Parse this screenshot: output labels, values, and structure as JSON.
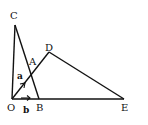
{
  "diagram": {
    "type": "geometry",
    "points": {
      "O": {
        "label": "O",
        "x": 12,
        "y": 99,
        "lx": 7,
        "ly": 110
      },
      "B": {
        "label": "B",
        "x": 39,
        "y": 99,
        "lx": 36,
        "ly": 110
      },
      "E": {
        "label": "E",
        "x": 124,
        "y": 99,
        "lx": 121,
        "ly": 110
      },
      "C": {
        "label": "C",
        "x": 15,
        "y": 25,
        "lx": 9,
        "ly": 18
      },
      "D": {
        "label": "D",
        "x": 49,
        "y": 52,
        "lx": 45,
        "ly": 50
      },
      "A": {
        "label": "A",
        "x": 30,
        "y": 75,
        "lx": 28,
        "ly": 65
      }
    },
    "segments": [
      [
        "O",
        "C"
      ],
      [
        "C",
        "B"
      ],
      [
        "O",
        "E"
      ],
      [
        "O",
        "D"
      ],
      [
        "D",
        "E"
      ]
    ],
    "vectors": [
      {
        "name": "a",
        "label": "a",
        "from": "O",
        "along": "D"
      },
      {
        "name": "b",
        "label": "b",
        "from": "O",
        "along": "E"
      }
    ],
    "stroke_color": "#111111"
  }
}
